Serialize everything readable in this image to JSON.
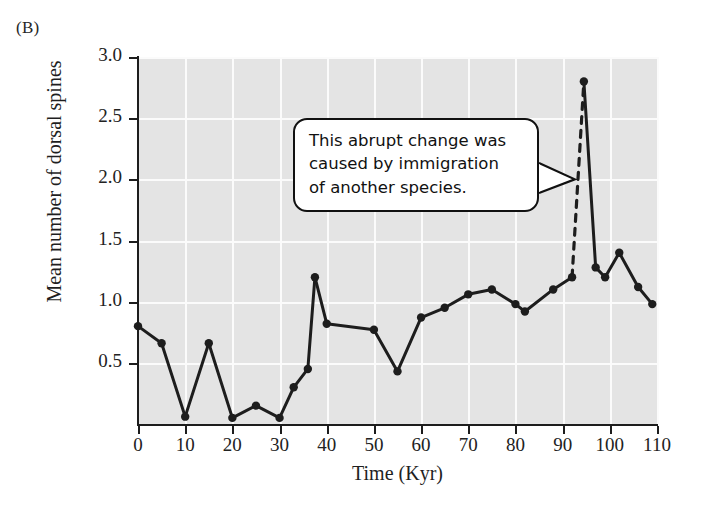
{
  "panel": {
    "label": "(B)"
  },
  "chart_data": {
    "type": "line",
    "title": "",
    "xlabel": "Time (Kyr)",
    "ylabel": "Mean number of dorsal spines",
    "xlim": [
      0,
      110
    ],
    "ylim": [
      0,
      3.0
    ],
    "xticks": [
      0,
      10,
      20,
      30,
      40,
      50,
      60,
      70,
      80,
      90,
      100,
      110
    ],
    "xtick_labels": [
      "0",
      "10",
      "20",
      "30",
      "40",
      "50",
      "60",
      "70",
      "80",
      "90",
      "100",
      "110"
    ],
    "yticks": [
      0.5,
      1.0,
      1.5,
      2.0,
      2.5,
      3.0
    ],
    "ytick_labels": [
      "0.5",
      "1.0",
      "1.5",
      "2.0",
      "2.5",
      "3.0"
    ],
    "grid": "white gridlines on gray panel, both axes",
    "legend": "none",
    "marker": "filled circle",
    "line_color": "#1d1d1d",
    "panel_color": "#e4e4e4",
    "gridline_color": "#fbfbfb",
    "points": [
      {
        "x": 0,
        "y": 0.8
      },
      {
        "x": 5,
        "y": 0.66
      },
      {
        "x": 10,
        "y": 0.06
      },
      {
        "x": 15,
        "y": 0.66
      },
      {
        "x": 20,
        "y": 0.05
      },
      {
        "x": 25,
        "y": 0.15
      },
      {
        "x": 30,
        "y": 0.05
      },
      {
        "x": 33,
        "y": 0.3
      },
      {
        "x": 36,
        "y": 0.45
      },
      {
        "x": 37.5,
        "y": 1.2
      },
      {
        "x": 40,
        "y": 0.82
      },
      {
        "x": 50,
        "y": 0.77
      },
      {
        "x": 55,
        "y": 0.43
      },
      {
        "x": 60,
        "y": 0.87
      },
      {
        "x": 65,
        "y": 0.95
      },
      {
        "x": 70,
        "y": 1.06
      },
      {
        "x": 75,
        "y": 1.1
      },
      {
        "x": 80,
        "y": 0.98
      },
      {
        "x": 82,
        "y": 0.92
      },
      {
        "x": 88,
        "y": 1.1
      },
      {
        "x": 92,
        "y": 1.2
      },
      {
        "x": 94.5,
        "y": 2.8
      },
      {
        "x": 97,
        "y": 1.28
      },
      {
        "x": 99,
        "y": 1.2
      },
      {
        "x": 102,
        "y": 1.4
      },
      {
        "x": 106,
        "y": 1.12
      },
      {
        "x": 109,
        "y": 0.98
      }
    ],
    "dashed_segment": {
      "from": {
        "x": 92,
        "y": 1.2
      },
      "to": {
        "x": 94.5,
        "y": 2.8
      }
    },
    "annotations": [
      {
        "name": "immigration-callout",
        "lines": [
          "This abrupt change was",
          "caused by immigration",
          "of another species."
        ],
        "points_to": {
          "x": 93,
          "y": 2.0
        }
      }
    ]
  }
}
